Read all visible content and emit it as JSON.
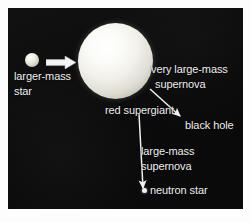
{
  "figure": {
    "background_color": "#ffffff",
    "panel_color": "#0a0a0a",
    "text_color": "#ededed"
  },
  "objects": {
    "small_star": {
      "name": "larger-mass star",
      "label_line1": "larger-mass",
      "label_line2": "star"
    },
    "supergiant": {
      "name": "red supergiant",
      "label": "red supergiant"
    },
    "black_hole": {
      "name": "black hole",
      "label": "black hole"
    },
    "neutron_star": {
      "name": "neutron star",
      "label": "neutron star"
    }
  },
  "processes": {
    "very_large_mass_supernova": {
      "line1": "very large-mass",
      "line2": "supernova"
    },
    "large_mass_supernova": {
      "line1": "large-mass",
      "line2": "supernova"
    }
  }
}
